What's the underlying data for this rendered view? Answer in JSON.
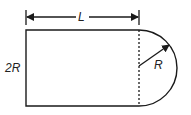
{
  "diagram": {
    "title": "",
    "labels": {
      "length": "L",
      "height": "2R",
      "radius": "R"
    },
    "shapes": [
      {
        "type": "rectangle",
        "x": 26,
        "y": 30,
        "width": 113,
        "height": 76
      },
      {
        "type": "semicircle",
        "cx": 139,
        "cy": 68,
        "r": 38,
        "side": "right"
      },
      {
        "type": "dashed-line",
        "x": 139,
        "y1": 30,
        "y2": 106
      },
      {
        "type": "dimension-arrow",
        "label": "L",
        "x1": 26,
        "x2": 139,
        "y": 17
      },
      {
        "type": "radius-arrow",
        "label": "R",
        "from": [
          139,
          66
        ],
        "to": [
          169,
          44
        ]
      }
    ],
    "colors": {
      "stroke": "#1a1a1a",
      "background": "#ffffff"
    }
  }
}
